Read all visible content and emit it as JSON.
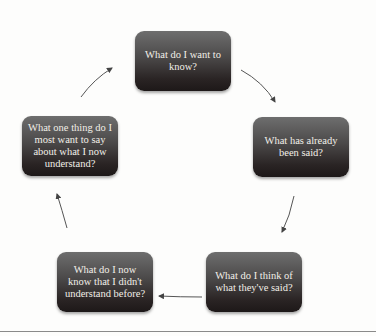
{
  "diagram": {
    "type": "cycle",
    "nodes": [
      {
        "id": "n1",
        "label": "What do I want to know?"
      },
      {
        "id": "n2",
        "label": "What has already been said?"
      },
      {
        "id": "n3",
        "label": "What do I think of what they've said?"
      },
      {
        "id": "n4",
        "label": "What do I now know that I didn't understand before?"
      },
      {
        "id": "n5",
        "label": "What one thing do I most want to say about what I now understand?"
      }
    ],
    "edges": [
      {
        "from": "n1",
        "to": "n2"
      },
      {
        "from": "n2",
        "to": "n3"
      },
      {
        "from": "n3",
        "to": "n4"
      },
      {
        "from": "n4",
        "to": "n5"
      },
      {
        "from": "n5",
        "to": "n1"
      }
    ],
    "colors": {
      "node_top": "#6e6e6e",
      "node_bottom": "#1d1818",
      "node_text": "#f2efe8",
      "arrow": "#555555",
      "background": "#fdfdfc"
    }
  }
}
